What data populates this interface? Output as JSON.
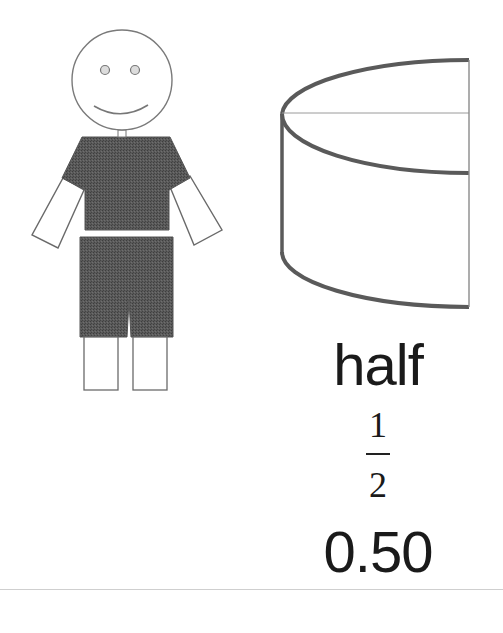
{
  "illustration": {
    "figure": {
      "description": "stick boy with dark shirt and shorts",
      "clothing_color": "#555555",
      "outline_color": "#777777"
    },
    "shape": {
      "description": "half cylinder (left half of a cylinder)",
      "stroke_color": "#555555"
    }
  },
  "labels": {
    "word": "half",
    "fraction_numerator": "1",
    "fraction_denominator": "2",
    "decimal": "0.50"
  }
}
